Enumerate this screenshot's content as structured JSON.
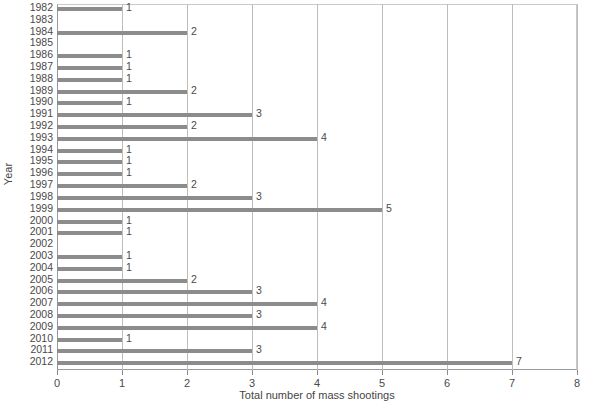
{
  "chart_data": {
    "type": "bar",
    "orientation": "horizontal",
    "title": "",
    "xlabel": "Total number of mass shootings",
    "ylabel": "Year",
    "xlim": [
      0,
      8
    ],
    "xticks": [
      "0",
      "1",
      "2",
      "3",
      "4",
      "5",
      "6",
      "7",
      "8"
    ],
    "grid": "vertical",
    "legend": "none",
    "bar_color": "#8c8c8c",
    "categories": [
      "1982",
      "1983",
      "1984",
      "1985",
      "1986",
      "1987",
      "1988",
      "1989",
      "1990",
      "1991",
      "1992",
      "1993",
      "1994",
      "1995",
      "1996",
      "1997",
      "1998",
      "1999",
      "2000",
      "2001",
      "2002",
      "2003",
      "2004",
      "2005",
      "2006",
      "2007",
      "2008",
      "2009",
      "2010",
      "2011",
      "2012"
    ],
    "values": [
      1,
      0,
      2,
      0,
      1,
      1,
      1,
      2,
      1,
      3,
      2,
      4,
      1,
      1,
      1,
      2,
      3,
      5,
      1,
      1,
      0,
      1,
      1,
      2,
      3,
      4,
      3,
      4,
      1,
      3,
      7
    ],
    "data_labels": [
      "1",
      "",
      "2",
      "",
      "1",
      "1",
      "1",
      "2",
      "1",
      "3",
      "2",
      "4",
      "1",
      "1",
      "1",
      "2",
      "3",
      "5",
      "1",
      "1",
      "",
      "1",
      "1",
      "2",
      "3",
      "4",
      "3",
      "4",
      "1",
      "3",
      "7"
    ]
  }
}
